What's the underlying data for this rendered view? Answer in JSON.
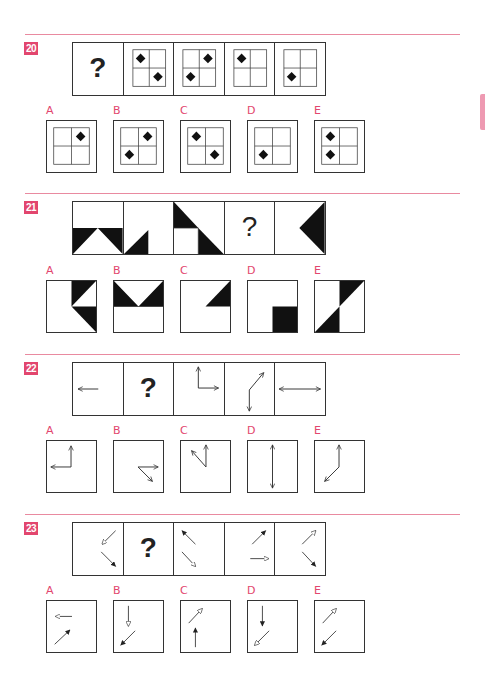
{
  "questions": [
    {
      "number": "20",
      "sequence": [
        {
          "type": "question_mark",
          "text": "?"
        },
        {
          "type": "grid",
          "diamonds": [
            "top-left",
            "bottom-right"
          ]
        },
        {
          "type": "grid",
          "diamonds": [
            "top-right",
            "bottom-left"
          ]
        },
        {
          "type": "grid",
          "diamonds": [
            "top-left"
          ]
        },
        {
          "type": "grid",
          "diamonds": [
            "bottom-left"
          ]
        }
      ],
      "options": [
        {
          "label": "A",
          "diamonds": [
            "top-right"
          ]
        },
        {
          "label": "B",
          "diamonds": [
            "top-right",
            "bottom-left"
          ]
        },
        {
          "label": "C",
          "diamonds": [
            "top-left",
            "bottom-right"
          ]
        },
        {
          "label": "D",
          "diamonds": [
            "bottom-left"
          ]
        },
        {
          "label": "E",
          "diamonds": [
            "top-left",
            "bottom-left"
          ]
        }
      ]
    },
    {
      "number": "21",
      "sequence": [
        {
          "type": "shape",
          "description": "bottom half black with white upward triangle"
        },
        {
          "type": "shape",
          "description": "small black triangle bottom-center-left"
        },
        {
          "type": "shape",
          "description": "black triangle top-left and black triangle bottom-right"
        },
        {
          "type": "question_mark",
          "text": "?"
        },
        {
          "type": "shape",
          "description": "black left-pointing triangle on right side"
        }
      ],
      "options": [
        {
          "label": "A",
          "description": "two black triangles right half"
        },
        {
          "label": "B",
          "description": "top half black with white downward triangle"
        },
        {
          "label": "C",
          "description": "black triangle top-right"
        },
        {
          "label": "D",
          "description": "black square bottom-right"
        },
        {
          "label": "E",
          "description": "two black triangles diagonal"
        }
      ]
    },
    {
      "number": "22",
      "sequence": [
        {
          "type": "arrow",
          "description": "left arrow"
        },
        {
          "type": "question_mark",
          "text": "?"
        },
        {
          "type": "arrow",
          "description": "up arrow and right arrow joined at corner"
        },
        {
          "type": "arrow",
          "description": "up-right arrow and down arrow joined"
        },
        {
          "type": "arrow",
          "description": "double-headed horizontal arrow"
        }
      ],
      "options": [
        {
          "label": "A",
          "description": "up arrow and left arrow joined at corner"
        },
        {
          "label": "B",
          "description": "right arrow and down-right arrow joined"
        },
        {
          "label": "C",
          "description": "up arrow and up-left arrow joined"
        },
        {
          "label": "D",
          "description": "double-headed vertical arrow"
        },
        {
          "label": "E",
          "description": "up arrow and down-left arrow joined"
        }
      ]
    },
    {
      "number": "23",
      "sequence": [
        {
          "type": "arrows",
          "description": "white down-left arrow, black down-right arrow"
        },
        {
          "type": "question_mark",
          "text": "?"
        },
        {
          "type": "arrows",
          "description": "black up-left arrow, white down-right arrow"
        },
        {
          "type": "arrows",
          "description": "black up-right arrow, white right arrow"
        },
        {
          "type": "arrows",
          "description": "white up-right arrow, black down-right arrow"
        }
      ],
      "options": [
        {
          "label": "A",
          "description": "white left arrow, black up-right arrow"
        },
        {
          "label": "B",
          "description": "white down arrow, black down-left arrow"
        },
        {
          "label": "C",
          "description": "white up-right arrow, black up arrow"
        },
        {
          "label": "D",
          "description": "black down arrow, white down-left arrow"
        },
        {
          "label": "E",
          "description": "white up-right arrow, black down-left arrow"
        }
      ]
    }
  ],
  "colors": {
    "accent": "#e2466e",
    "rule": "#e98aa0",
    "ink": "#222222"
  }
}
